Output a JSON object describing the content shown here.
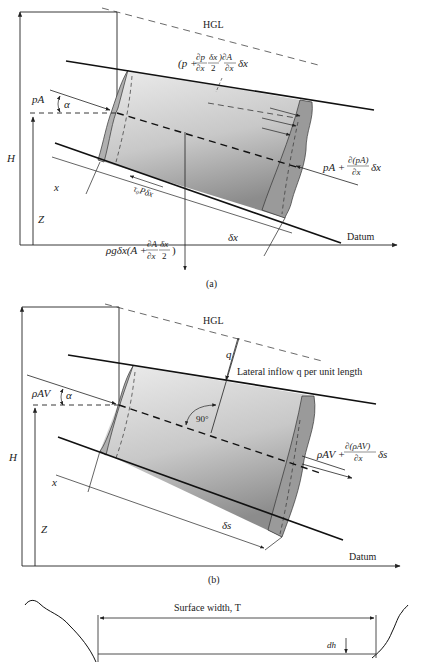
{
  "figure": {
    "panel_a": {
      "caption": "(a)",
      "hgl_label": "HGL",
      "datum_label": "Datum",
      "H_label": "H",
      "Z_label": "Z",
      "x_label": "x",
      "dx_label": "δx",
      "alpha_label": "α",
      "inlet_force": "pA",
      "outlet_force_lhs": "pA +",
      "outlet_force_num": "∂(pA)",
      "outlet_force_den": "∂x",
      "outlet_force_rhs": "δx",
      "side_force_open": "(p +",
      "side_force_dp": "∂p",
      "side_force_dx": "∂x",
      "side_force_dx2_num": "δx",
      "side_force_dx2_den": "2",
      "side_force_dA": ")∂A",
      "side_force_dA_den": "∂x",
      "side_force_tail": "δx",
      "shear_label": "τ₀Pδx",
      "weight_lhs": "ρgδx(A +",
      "weight_dA": "∂A",
      "weight_dA_den": "∂x",
      "weight_dx2_num": "δx",
      "weight_dx2_den": "2",
      "weight_close": ")"
    },
    "panel_b": {
      "caption": "(b)",
      "hgl_label": "HGL",
      "datum_label": "Datum",
      "H_label": "H",
      "Z_label": "Z",
      "x_label": "x",
      "ds_label": "δs",
      "alpha_label": "α",
      "q_label": "q",
      "lateral_inflow_label": "Lateral inflow q per unit length",
      "angle_label": "90°",
      "inlet_flux": "ρAV",
      "outlet_flux_lhs": "ρAV +",
      "outlet_flux_num": "∂(ρAV)",
      "outlet_flux_den": "∂x",
      "outlet_flux_rhs": "δs"
    },
    "panel_c": {
      "surface_width_label": "Surface width, T",
      "dh_label": "dh"
    },
    "colors": {
      "ink": "#222222",
      "tube_fill_light": "#e6e6e6",
      "tube_fill_dark": "#8a8a8a",
      "end_face": "#9a9a9a"
    }
  }
}
